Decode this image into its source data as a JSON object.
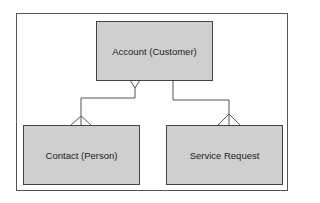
{
  "diagram": {
    "type": "entity-relationship",
    "entities": [
      {
        "id": "account",
        "label": "Account (Customer)"
      },
      {
        "id": "contact",
        "label": "Contact (Person)"
      },
      {
        "id": "service_request",
        "label": "Service Request"
      }
    ],
    "relationships": [
      {
        "from": "account",
        "to": "contact",
        "from_end": "many",
        "to_end": "many"
      },
      {
        "from": "account",
        "to": "service_request",
        "from_end": "one",
        "to_end": "many"
      }
    ],
    "colors": {
      "entity_fill": "#cfcfcf",
      "stroke": "#444444"
    }
  }
}
